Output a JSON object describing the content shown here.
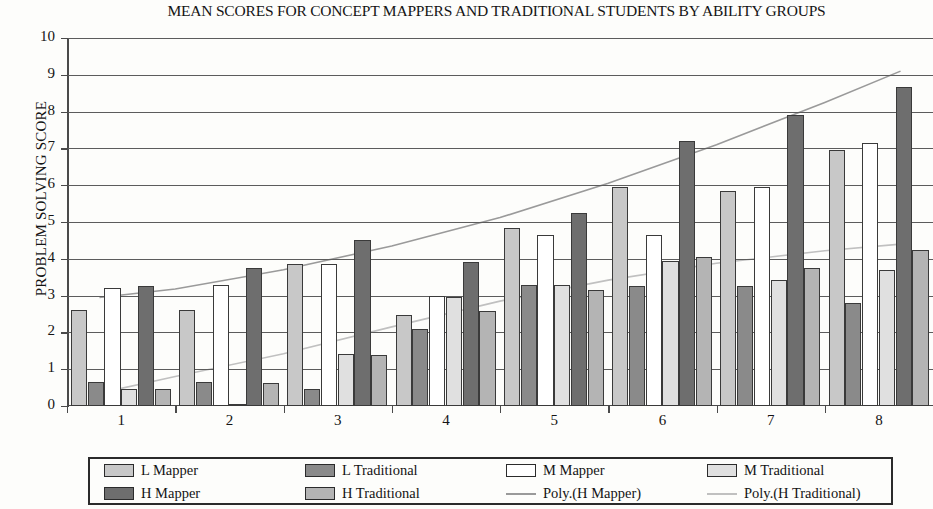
{
  "chart_data": {
    "type": "bar",
    "title": "MEAN SCORES FOR CONCEPT MAPPERS AND TRADITIONAL STUDENTS BY ABILITY GROUPS",
    "xlabel": "",
    "ylabel": "PROBLEM SOLVING SCORE",
    "ylim": [
      0,
      10
    ],
    "ytick_labels": [
      "0",
      "1",
      "2",
      "3",
      "4",
      "5",
      "6",
      "7",
      "8",
      "9",
      "10"
    ],
    "yticks": [
      0,
      1,
      2,
      3,
      4,
      5,
      6,
      7,
      8,
      9,
      10
    ],
    "grid": true,
    "legend_position": "bottom",
    "categories": [
      "1",
      "2",
      "3",
      "4",
      "5",
      "6",
      "7",
      "8"
    ],
    "series": [
      {
        "name": "L Mapper",
        "color": "#c8c8c8",
        "values": [
          2.62,
          2.62,
          3.85,
          2.48,
          4.85,
          5.95,
          5.85,
          6.95
        ]
      },
      {
        "name": "L Traditional",
        "color": "#8a8a8a",
        "values": [
          0.65,
          0.65,
          0.45,
          2.1,
          3.3,
          3.25,
          3.25,
          2.8
        ]
      },
      {
        "name": "M Mapper",
        "color": "#ffffff",
        "values": [
          3.2,
          3.3,
          3.85,
          2.98,
          4.65,
          4.65,
          5.95,
          7.15
        ]
      },
      {
        "name": "M Traditional",
        "color": "#e0e0e0",
        "values": [
          0.45,
          0.05,
          1.42,
          2.95,
          3.3,
          3.95,
          3.42,
          3.7
        ]
      },
      {
        "name": "H Mapper",
        "color": "#6e6e6e",
        "values": [
          3.25,
          3.75,
          4.5,
          3.9,
          5.25,
          7.2,
          7.9,
          8.68
        ]
      },
      {
        "name": "H Traditional",
        "color": "#b4b4b4",
        "values": [
          0.45,
          0.62,
          1.38,
          2.58,
          3.15,
          4.05,
          3.75,
          4.25
        ]
      }
    ],
    "trendlines": [
      {
        "name": "Poly.(H Mapper)",
        "color": "#9a9a9a",
        "points": [
          [
            0.3,
            2.95
          ],
          [
            1.0,
            3.18
          ],
          [
            2.0,
            3.7
          ],
          [
            3.0,
            4.35
          ],
          [
            4.0,
            5.12
          ],
          [
            5.0,
            6.05
          ],
          [
            6.0,
            7.1
          ],
          [
            7.0,
            8.25
          ],
          [
            7.7,
            9.1
          ]
        ]
      },
      {
        "name": "Poly.(H Traditional)",
        "color": "#c0c0c0",
        "points": [
          [
            0.3,
            0.35
          ],
          [
            1.0,
            0.8
          ],
          [
            2.0,
            1.42
          ],
          [
            3.0,
            2.15
          ],
          [
            4.0,
            2.85
          ],
          [
            5.0,
            3.42
          ],
          [
            6.0,
            3.88
          ],
          [
            7.0,
            4.22
          ],
          [
            7.7,
            4.4
          ]
        ]
      }
    ]
  },
  "legend": {
    "items": [
      {
        "label": "L Mapper",
        "kind": "swatch",
        "color": "#c8c8c8"
      },
      {
        "label": "L Traditional",
        "kind": "swatch",
        "color": "#8a8a8a"
      },
      {
        "label": "M Mapper",
        "kind": "swatch",
        "color": "#ffffff"
      },
      {
        "label": "M Traditional",
        "kind": "swatch",
        "color": "#e0e0e0"
      },
      {
        "label": "H Mapper",
        "kind": "swatch",
        "color": "#6e6e6e"
      },
      {
        "label": "H Traditional",
        "kind": "swatch",
        "color": "#b4b4b4"
      },
      {
        "label": "Poly.(H Mapper)",
        "kind": "line",
        "color": "#9a9a9a"
      },
      {
        "label": "Poly.(H Traditional)",
        "kind": "line",
        "color": "#c0c0c0"
      }
    ]
  }
}
